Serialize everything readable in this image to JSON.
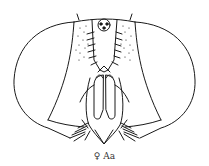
{
  "figure": {
    "caption": "♀ Aa",
    "line_color": "#1a1a1a",
    "background": "#ffffff"
  }
}
